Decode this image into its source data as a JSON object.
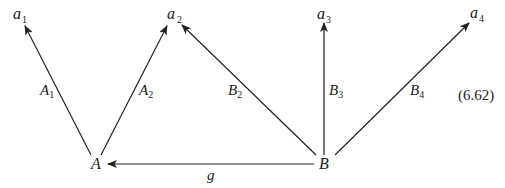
{
  "diagram": {
    "equation_number": "(6.62)",
    "nodes": {
      "a1": {
        "base": "a",
        "sub": "1"
      },
      "a2": {
        "base": "a",
        "sub": "2"
      },
      "a3": {
        "base": "a",
        "sub": "3"
      },
      "a4": {
        "base": "a",
        "sub": "4"
      },
      "A": {
        "base": "A",
        "sub": ""
      },
      "B": {
        "base": "B",
        "sub": ""
      }
    },
    "edges": {
      "A1": {
        "from": "A",
        "to": "a1",
        "base": "A",
        "sub": "1"
      },
      "A2": {
        "from": "A",
        "to": "a2",
        "base": "A",
        "sub": "2"
      },
      "B2": {
        "from": "B",
        "to": "a2",
        "base": "B",
        "sub": "2"
      },
      "B3": {
        "from": "B",
        "to": "a3",
        "base": "B",
        "sub": "3"
      },
      "B4": {
        "from": "B",
        "to": "a4",
        "base": "B",
        "sub": "4"
      },
      "g": {
        "from": "B",
        "to": "A",
        "base": "g",
        "sub": ""
      }
    }
  }
}
